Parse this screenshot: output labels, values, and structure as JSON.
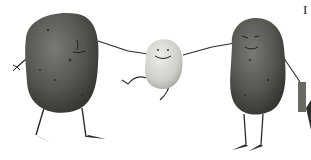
{
  "image": {
    "description": "Illustration of three potato characters holding hands: a large dark potato on the left, a small pale smiling potato in the middle, and a large dark smiling potato on the right holding a small object; a partial figure is cut off at the right edge.",
    "characters": [
      {
        "name": "left-potato",
        "tone": "dark",
        "size": "large"
      },
      {
        "name": "middle-potato",
        "tone": "light",
        "size": "small",
        "expression": "smile"
      },
      {
        "name": "right-potato",
        "tone": "dark",
        "size": "large",
        "expression": "smile"
      }
    ],
    "colors": {
      "background": "#ffffff",
      "dark_potato": "#5a5a55",
      "dark_potato_shade": "#3c3c38",
      "light_potato": "#d8d8d2",
      "limbs": "#2a2a2a"
    },
    "edge_glyph": "I"
  }
}
